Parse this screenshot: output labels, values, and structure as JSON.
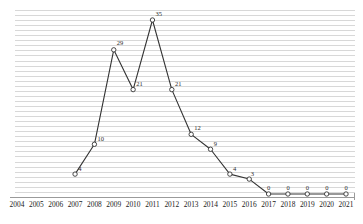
{
  "chart_data": {
    "type": "line",
    "title": "",
    "subtitle": "",
    "xlabel": "",
    "ylabel": "",
    "grid": true,
    "legend": false,
    "legend_position": "none",
    "xlim": [
      2004,
      2021
    ],
    "ylim": [
      0,
      36
    ],
    "categories": [
      "2004",
      "2005",
      "2006",
      "2007",
      "2008",
      "2009",
      "2010",
      "2011",
      "2012",
      "2013",
      "2014",
      "2015",
      "2016",
      "2017",
      "2018",
      "2019",
      "2020",
      "2021"
    ],
    "x": [
      2004,
      2005,
      2006,
      2007,
      2008,
      2009,
      2010,
      2011,
      2012,
      2013,
      2014,
      2015,
      2016,
      2017,
      2018,
      2019,
      2020,
      2021
    ],
    "values": [
      null,
      null,
      null,
      4,
      10,
      29,
      21,
      35,
      21,
      12,
      9,
      4,
      3,
      0,
      0,
      0,
      0,
      0
    ],
    "point_labels": [
      "",
      "",
      "",
      "4",
      "10",
      "29",
      "21",
      "35",
      "21",
      "12",
      "9",
      "4",
      "3",
      "0",
      "0",
      "0",
      "0",
      "0"
    ],
    "marker": "open-circle",
    "series": [
      {
        "name": "series-1",
        "values": [
          null,
          null,
          null,
          4,
          10,
          29,
          21,
          35,
          21,
          12,
          9,
          4,
          3,
          0,
          0,
          0,
          0,
          0
        ]
      }
    ],
    "colors": {
      "line": "#333333",
      "marker_stroke": "#333333",
      "marker_fill": "#ffffff",
      "gridline": "#d8d8d8",
      "axis": "#9a9a9a",
      "label_text": "#2b2b2b",
      "tick_text": "#1a1a1a",
      "background": "#ffffff"
    }
  },
  "axis": {
    "tick_labels": [
      "2004",
      "2005",
      "2006",
      "2007",
      "2008",
      "2009",
      "2010",
      "2011",
      "2012",
      "2013",
      "2014",
      "2015",
      "2016",
      "2017",
      "2018",
      "2019",
      "2020",
      "2021"
    ]
  },
  "labels": {
    "p2007": "4",
    "p2008": "10",
    "p2009": "29",
    "p2010": "21",
    "p2011": "35",
    "p2012": "21",
    "p2013": "12",
    "p2014": "9",
    "p2015": "4",
    "p2016": "3",
    "p2017": "0",
    "p2018": "0",
    "p2019": "0",
    "p2020": "0",
    "p2021": "0"
  }
}
